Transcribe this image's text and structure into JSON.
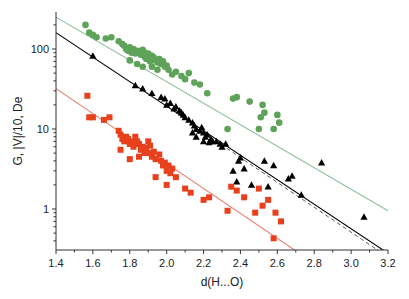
{
  "chart_data": {
    "type": "scatter",
    "title": "",
    "xlabel": "d(H...O)",
    "ylabel": "G, |V|/10, De",
    "xlim": [
      1.4,
      3.2
    ],
    "ylim": [
      0.3,
      290
    ],
    "yscale": "log",
    "grid": false,
    "legend": "none",
    "x_ticks": [
      "1.4",
      "1.6",
      "1.8",
      "2.0",
      "2.2",
      "2.4",
      "2.6",
      "2.8",
      "3.0",
      "3.2"
    ],
    "x_tick_values": [
      1.4,
      1.6,
      1.8,
      2.0,
      2.2,
      2.4,
      2.6,
      2.8,
      3.0,
      3.2
    ],
    "y_ticks": [
      "1",
      "10",
      "100"
    ],
    "y_tick_values": [
      1,
      10,
      100
    ],
    "series": [
      {
        "name": "G",
        "marker": "circle",
        "color": "#5fa35a",
        "points": [
          [
            1.56,
            200
          ],
          [
            1.58,
            160
          ],
          [
            1.6,
            150
          ],
          [
            1.62,
            140
          ],
          [
            1.67,
            135
          ],
          [
            1.7,
            140
          ],
          [
            1.74,
            125
          ],
          [
            1.76,
            115
          ],
          [
            1.77,
            110
          ],
          [
            1.78,
            100
          ],
          [
            1.79,
            95
          ],
          [
            1.8,
            105
          ],
          [
            1.81,
            90
          ],
          [
            1.82,
            100
          ],
          [
            1.83,
            88
          ],
          [
            1.84,
            95
          ],
          [
            1.85,
            92
          ],
          [
            1.86,
            85
          ],
          [
            1.87,
            98
          ],
          [
            1.88,
            80
          ],
          [
            1.88,
            90
          ],
          [
            1.89,
            75
          ],
          [
            1.9,
            88
          ],
          [
            1.91,
            70
          ],
          [
            1.92,
            82
          ],
          [
            1.93,
            78
          ],
          [
            1.94,
            72
          ],
          [
            1.95,
            68
          ],
          [
            1.96,
            75
          ],
          [
            1.97,
            65
          ],
          [
            1.98,
            70
          ],
          [
            1.99,
            60
          ],
          [
            2.0,
            62
          ],
          [
            2.01,
            55
          ],
          [
            1.8,
            72
          ],
          [
            1.84,
            65
          ],
          [
            1.87,
            60
          ],
          [
            2.03,
            48
          ],
          [
            2.05,
            52
          ],
          [
            2.08,
            46
          ],
          [
            2.1,
            42
          ],
          [
            2.12,
            50
          ],
          [
            2.15,
            38
          ],
          [
            2.18,
            36
          ],
          [
            1.95,
            55
          ],
          [
            1.92,
            60
          ],
          [
            2.36,
            24
          ],
          [
            2.38,
            25
          ],
          [
            2.45,
            22
          ],
          [
            2.52,
            20
          ],
          [
            2.53,
            16
          ],
          [
            2.51,
            14
          ],
          [
            2.6,
            15
          ],
          [
            2.61,
            12
          ],
          [
            2.58,
            10
          ],
          [
            2.5,
            10
          ],
          [
            2.33,
            10
          ],
          [
            2.22,
            28
          ]
        ]
      },
      {
        "name": "|V|/10",
        "marker": "triangle",
        "color": "#000000",
        "points": [
          [
            1.6,
            82
          ],
          [
            1.83,
            35
          ],
          [
            1.87,
            32
          ],
          [
            1.92,
            28
          ],
          [
            1.97,
            25
          ],
          [
            1.99,
            24
          ],
          [
            2.0,
            20
          ],
          [
            2.02,
            21
          ],
          [
            2.04,
            18
          ],
          [
            2.05,
            19
          ],
          [
            2.07,
            17
          ],
          [
            2.08,
            16
          ],
          [
            2.09,
            15
          ],
          [
            2.1,
            14
          ],
          [
            2.12,
            13
          ],
          [
            2.14,
            12
          ],
          [
            2.15,
            11
          ],
          [
            2.16,
            10
          ],
          [
            2.18,
            9.5
          ],
          [
            2.19,
            10.5
          ],
          [
            2.2,
            9
          ],
          [
            2.21,
            8
          ],
          [
            2.22,
            8.5
          ],
          [
            2.24,
            7.5
          ],
          [
            2.25,
            7
          ],
          [
            2.27,
            7
          ],
          [
            2.29,
            6.5
          ],
          [
            2.3,
            6
          ],
          [
            2.32,
            6.5
          ],
          [
            2.14,
            9
          ],
          [
            2.16,
            8
          ],
          [
            2.2,
            7
          ],
          [
            2.23,
            6.8
          ],
          [
            2.4,
            4.4
          ],
          [
            2.42,
            3.2
          ],
          [
            2.39,
            4.0
          ],
          [
            2.36,
            3.0
          ],
          [
            2.53,
            4.0
          ],
          [
            2.58,
            3.5
          ],
          [
            2.68,
            2.6
          ],
          [
            2.38,
            2.2
          ],
          [
            2.55,
            1.9
          ],
          [
            2.66,
            2.4
          ],
          [
            2.73,
            1.5
          ],
          [
            2.84,
            3.8
          ],
          [
            3.07,
            0.8
          ],
          [
            2.46,
            2.0
          ]
        ]
      },
      {
        "name": "De",
        "marker": "square",
        "color": "#e8401c",
        "points": [
          [
            1.57,
            26
          ],
          [
            1.58,
            14
          ],
          [
            1.6,
            14
          ],
          [
            1.66,
            13
          ],
          [
            1.69,
            14
          ],
          [
            1.74,
            9.5
          ],
          [
            1.75,
            8.5
          ],
          [
            1.76,
            7.5
          ],
          [
            1.77,
            7.0
          ],
          [
            1.78,
            8.0
          ],
          [
            1.79,
            7.5
          ],
          [
            1.8,
            6.5
          ],
          [
            1.81,
            7.0
          ],
          [
            1.82,
            6.0
          ],
          [
            1.83,
            8.0
          ],
          [
            1.84,
            7.0
          ],
          [
            1.85,
            6.5
          ],
          [
            1.86,
            5.5
          ],
          [
            1.87,
            6.0
          ],
          [
            1.88,
            5.0
          ],
          [
            1.89,
            5.8
          ],
          [
            1.9,
            7.0
          ],
          [
            1.9,
            5.0
          ],
          [
            1.91,
            6.2
          ],
          [
            1.92,
            4.5
          ],
          [
            1.93,
            5.2
          ],
          [
            1.94,
            4.2
          ],
          [
            1.96,
            4.8
          ],
          [
            1.97,
            4.0
          ],
          [
            1.98,
            3.5
          ],
          [
            1.99,
            3.8
          ],
          [
            2.0,
            3.0
          ],
          [
            2.01,
            3.5
          ],
          [
            2.02,
            2.8
          ],
          [
            2.03,
            3.2
          ],
          [
            1.8,
            4.2
          ],
          [
            1.85,
            4.5
          ],
          [
            1.75,
            5.5
          ],
          [
            2.05,
            2.5
          ],
          [
            2.1,
            1.8
          ],
          [
            2.13,
            1.6
          ],
          [
            2.2,
            1.3
          ],
          [
            2.23,
            1.4
          ],
          [
            2.0,
            2.0
          ],
          [
            1.94,
            2.5
          ],
          [
            2.35,
            1.9
          ],
          [
            2.38,
            1.7
          ],
          [
            2.42,
            1.4
          ],
          [
            2.5,
            1.8
          ],
          [
            2.52,
            1.1
          ],
          [
            2.55,
            1.3
          ],
          [
            2.59,
            0.9
          ],
          [
            2.62,
            0.7
          ],
          [
            2.48,
            0.9
          ],
          [
            2.58,
            0.43
          ],
          [
            2.33,
            0.95
          ]
        ]
      }
    ],
    "fit_lines": [
      {
        "name": "G fit",
        "color": "#8fbf9a",
        "style": "solid",
        "from": [
          1.4,
          250
        ],
        "to": [
          3.2,
          0.95
        ]
      },
      {
        "name": "|V|/10 fit",
        "color": "#000000",
        "style": "solid",
        "from": [
          1.4,
          160
        ],
        "to": [
          3.18,
          0.3
        ]
      },
      {
        "name": "|V|/10 fit (dashed)",
        "color": "#444444",
        "style": "dashed",
        "from": [
          2.2,
          9
        ],
        "to": [
          3.15,
          0.3
        ]
      },
      {
        "name": "De fit",
        "color": "#e88070",
        "style": "solid",
        "from": [
          1.4,
          32
        ],
        "to": [
          2.7,
          0.3
        ]
      }
    ]
  }
}
